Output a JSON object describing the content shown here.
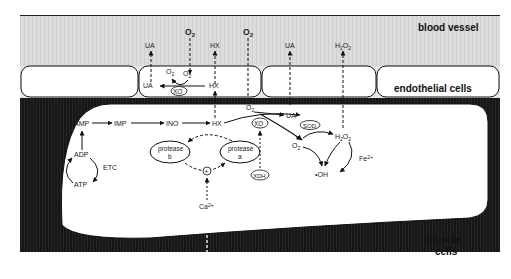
{
  "figure": {
    "regions": {
      "blood_vessel": "blood vessel",
      "endothelial": "endothelial cells",
      "muscle": [
        "muscle",
        "cells"
      ]
    },
    "colors": {
      "vessel_bg": "#d9d9d9",
      "extracellular_bg": "#1a1a1a",
      "cell_fill": "#ffffff",
      "line": "#111111"
    },
    "vessel_labels": {
      "o2_left": "O2",
      "o2_right": "O2",
      "ua_left": "UA",
      "hx": "HX",
      "ua_right": "UA",
      "h2o2": "H2O2"
    },
    "endothelial_labels": {
      "superoxide": "O2",
      "superoxide_dot": "•",
      "superoxide_charge": "-",
      "o2": "O2",
      "ua": "UA",
      "hx": "HX",
      "xo": "XO"
    },
    "muscle_labels": {
      "amp": "AMP",
      "imp": "IMP",
      "ino": "INO",
      "hx": "HX",
      "adp": "ADP",
      "atp": "ATP",
      "etc": "ETC",
      "protease_b": [
        "protease",
        "b"
      ],
      "protease_a": [
        "protease",
        "a"
      ],
      "plus": "+",
      "ca_in": "Ca2+",
      "ca_out": "Ca2+",
      "o2": "O2",
      "xo": "XO",
      "ua": "UA",
      "xdh": "XDH",
      "sod": "SOD",
      "superoxide": "O2",
      "h2o2": "H2O2",
      "fe": "Fe2+",
      "oh": "•OH"
    }
  }
}
